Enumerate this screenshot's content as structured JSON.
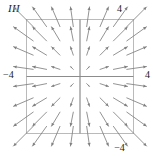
{
  "figure": {
    "panel_label": "III",
    "labels": {
      "top": "4",
      "bottom": "−4",
      "left": "−4",
      "right": "4"
    }
  },
  "colors": {
    "arrow": "#808080",
    "axis": "#8c8c8c",
    "frame": "#b3b3b3",
    "text": "#1a1a1a",
    "background": "#ffffff"
  },
  "chart_data": {
    "type": "scatter",
    "subtype": "vector-field",
    "title": "III",
    "xlabel": "",
    "ylabel": "",
    "xlim": [
      -4,
      4
    ],
    "ylim": [
      -4,
      4
    ],
    "grid": false,
    "legend": null,
    "axes_drawn": [
      "x-axis at y=0",
      "y-axis at x=0"
    ],
    "tick_labels": {
      "top": "4",
      "bottom": "-4",
      "left": "-4",
      "right": "4"
    },
    "field_formula": "F(x, y) = (x, y)",
    "grid_points_per_axis": 8,
    "sample_x": [
      -3.5,
      -2.5,
      -1.5,
      -0.5,
      0.5,
      1.5,
      2.5,
      3.5
    ],
    "sample_y": [
      3.5,
      2.5,
      1.5,
      0.5,
      -0.5,
      -1.5,
      -2.5,
      -3.5
    ],
    "arrow_scale": 0.42,
    "vectors": [
      {
        "x": -3.5,
        "y": 3.5,
        "u": -3.5,
        "v": 3.5
      },
      {
        "x": -2.5,
        "y": 3.5,
        "u": -2.5,
        "v": 3.5
      },
      {
        "x": -1.5,
        "y": 3.5,
        "u": -1.5,
        "v": 3.5
      },
      {
        "x": -0.5,
        "y": 3.5,
        "u": -0.5,
        "v": 3.5
      },
      {
        "x": 0.5,
        "y": 3.5,
        "u": 0.5,
        "v": 3.5
      },
      {
        "x": 1.5,
        "y": 3.5,
        "u": 1.5,
        "v": 3.5
      },
      {
        "x": 2.5,
        "y": 3.5,
        "u": 2.5,
        "v": 3.5
      },
      {
        "x": 3.5,
        "y": 3.5,
        "u": 3.5,
        "v": 3.5
      },
      {
        "x": -3.5,
        "y": 2.5,
        "u": -3.5,
        "v": 2.5
      },
      {
        "x": -2.5,
        "y": 2.5,
        "u": -2.5,
        "v": 2.5
      },
      {
        "x": -1.5,
        "y": 2.5,
        "u": -1.5,
        "v": 2.5
      },
      {
        "x": -0.5,
        "y": 2.5,
        "u": -0.5,
        "v": 2.5
      },
      {
        "x": 0.5,
        "y": 2.5,
        "u": 0.5,
        "v": 2.5
      },
      {
        "x": 1.5,
        "y": 2.5,
        "u": 1.5,
        "v": 2.5
      },
      {
        "x": 2.5,
        "y": 2.5,
        "u": 2.5,
        "v": 2.5
      },
      {
        "x": 3.5,
        "y": 2.5,
        "u": 3.5,
        "v": 2.5
      },
      {
        "x": -3.5,
        "y": 1.5,
        "u": -3.5,
        "v": 1.5
      },
      {
        "x": -2.5,
        "y": 1.5,
        "u": -2.5,
        "v": 1.5
      },
      {
        "x": -1.5,
        "y": 1.5,
        "u": -1.5,
        "v": 1.5
      },
      {
        "x": -0.5,
        "y": 1.5,
        "u": -0.5,
        "v": 1.5
      },
      {
        "x": 0.5,
        "y": 1.5,
        "u": 0.5,
        "v": 1.5
      },
      {
        "x": 1.5,
        "y": 1.5,
        "u": 1.5,
        "v": 1.5
      },
      {
        "x": 2.5,
        "y": 1.5,
        "u": 2.5,
        "v": 1.5
      },
      {
        "x": 3.5,
        "y": 1.5,
        "u": 3.5,
        "v": 1.5
      },
      {
        "x": -3.5,
        "y": 0.5,
        "u": -3.5,
        "v": 0.5
      },
      {
        "x": -2.5,
        "y": 0.5,
        "u": -2.5,
        "v": 0.5
      },
      {
        "x": -1.5,
        "y": 0.5,
        "u": -1.5,
        "v": 0.5
      },
      {
        "x": -0.5,
        "y": 0.5,
        "u": -0.5,
        "v": 0.5
      },
      {
        "x": 0.5,
        "y": 0.5,
        "u": 0.5,
        "v": 0.5
      },
      {
        "x": 1.5,
        "y": 0.5,
        "u": 1.5,
        "v": 0.5
      },
      {
        "x": 2.5,
        "y": 0.5,
        "u": 2.5,
        "v": 0.5
      },
      {
        "x": 3.5,
        "y": 0.5,
        "u": 3.5,
        "v": 0.5
      },
      {
        "x": -3.5,
        "y": -0.5,
        "u": -3.5,
        "v": -0.5
      },
      {
        "x": -2.5,
        "y": -0.5,
        "u": -2.5,
        "v": -0.5
      },
      {
        "x": -1.5,
        "y": -0.5,
        "u": -1.5,
        "v": -0.5
      },
      {
        "x": -0.5,
        "y": -0.5,
        "u": -0.5,
        "v": -0.5
      },
      {
        "x": 0.5,
        "y": -0.5,
        "u": 0.5,
        "v": -0.5
      },
      {
        "x": 1.5,
        "y": -0.5,
        "u": 1.5,
        "v": -0.5
      },
      {
        "x": 2.5,
        "y": -0.5,
        "u": 2.5,
        "v": -0.5
      },
      {
        "x": 3.5,
        "y": -0.5,
        "u": 3.5,
        "v": -0.5
      },
      {
        "x": -3.5,
        "y": -1.5,
        "u": -3.5,
        "v": -1.5
      },
      {
        "x": -2.5,
        "y": -1.5,
        "u": -2.5,
        "v": -1.5
      },
      {
        "x": -1.5,
        "y": -1.5,
        "u": -1.5,
        "v": -1.5
      },
      {
        "x": -0.5,
        "y": -1.5,
        "u": -0.5,
        "v": -1.5
      },
      {
        "x": 0.5,
        "y": -1.5,
        "u": 0.5,
        "v": -1.5
      },
      {
        "x": 1.5,
        "y": -1.5,
        "u": 1.5,
        "v": -1.5
      },
      {
        "x": 2.5,
        "y": -1.5,
        "u": 2.5,
        "v": -1.5
      },
      {
        "x": 3.5,
        "y": -1.5,
        "u": 3.5,
        "v": -1.5
      },
      {
        "x": -3.5,
        "y": -2.5,
        "u": -3.5,
        "v": -2.5
      },
      {
        "x": -2.5,
        "y": -2.5,
        "u": -2.5,
        "v": -2.5
      },
      {
        "x": -1.5,
        "y": -2.5,
        "u": -1.5,
        "v": -2.5
      },
      {
        "x": -0.5,
        "y": -2.5,
        "u": -0.5,
        "v": -2.5
      },
      {
        "x": 0.5,
        "y": -2.5,
        "u": 0.5,
        "v": -2.5
      },
      {
        "x": 1.5,
        "y": -2.5,
        "u": 1.5,
        "v": -2.5
      },
      {
        "x": 2.5,
        "y": -2.5,
        "u": 2.5,
        "v": -2.5
      },
      {
        "x": 3.5,
        "y": -2.5,
        "u": 3.5,
        "v": -2.5
      },
      {
        "x": -3.5,
        "y": -3.5,
        "u": -3.5,
        "v": -3.5
      },
      {
        "x": -2.5,
        "y": -3.5,
        "u": -2.5,
        "v": -3.5
      },
      {
        "x": -1.5,
        "y": -3.5,
        "u": -1.5,
        "v": -3.5
      },
      {
        "x": -0.5,
        "y": -3.5,
        "u": -0.5,
        "v": -3.5
      },
      {
        "x": 0.5,
        "y": -3.5,
        "u": 0.5,
        "v": -3.5
      },
      {
        "x": 1.5,
        "y": -3.5,
        "u": 1.5,
        "v": -3.5
      },
      {
        "x": 2.5,
        "y": -3.5,
        "u": 2.5,
        "v": -3.5
      },
      {
        "x": 3.5,
        "y": -3.5,
        "u": 3.5,
        "v": -3.5
      }
    ]
  }
}
